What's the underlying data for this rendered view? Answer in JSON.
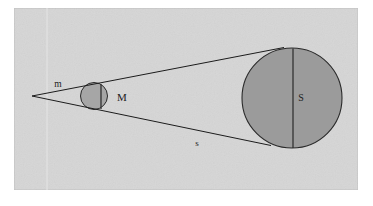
{
  "figure": {
    "background_color": "#ffffff",
    "panel_color": "#d6d6d6",
    "panel_border_color": "#b9b9b9",
    "stroke_color": "#1c1c1c",
    "circle_fill_color": "#9a9a9a",
    "circle_fill_color_small": "#a8a8a8",
    "labels": {
      "apex_ray": "m",
      "small_circle": "M",
      "large_circle": "S",
      "lower_ray": "s"
    }
  },
  "geometry": {
    "panel": {
      "x": 14,
      "y": 8,
      "width": 344,
      "height": 182
    },
    "apex": {
      "x": 32,
      "y": 96
    },
    "small_circle": {
      "cx": 94,
      "cy": 96,
      "r": 13.5
    },
    "large_circle": {
      "cx": 292,
      "cy": 98,
      "r": 50
    },
    "upper_tangent": {
      "x1": 32,
      "y1": 96,
      "x2": 283,
      "y2": 48
    },
    "lower_tangent": {
      "x1": 32,
      "y1": 96,
      "x2": 272,
      "y2": 145
    },
    "small_diameter": {
      "x": 101,
      "y1": 83,
      "y2": 110
    },
    "large_diameter": {
      "x": 293,
      "y1": 48,
      "y2": 148
    },
    "label_positions": {
      "m": {
        "x": 58,
        "y": 87
      },
      "M": {
        "x": 118,
        "y": 101
      },
      "S": {
        "x": 297,
        "y": 101
      },
      "s": {
        "x": 194,
        "y": 146
      }
    }
  }
}
